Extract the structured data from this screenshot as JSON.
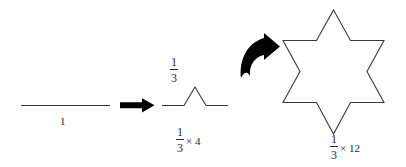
{
  "figure": {
    "background_color": "#ffffff",
    "stroke_color": "#3a3a3a",
    "arrow_color": "#000000",
    "stages": [
      {
        "name": "initiator-segment",
        "description": "single horizontal straight line segment",
        "label_text": "1",
        "length_label": "1",
        "segment_count": 1
      },
      {
        "name": "koch-generator",
        "description": "line with equilateral triangular bump, four segments",
        "height_label_numerator": "1",
        "height_label_denominator": "3",
        "length_label_numerator": "1",
        "length_label_denominator": "3",
        "length_label_multiplier": "× 4",
        "segment_count": 4
      },
      {
        "name": "koch-star-iteration",
        "description": "six pointed star outline, twelve segments",
        "length_label_numerator": "1",
        "length_label_denominator": "3",
        "length_label_multiplier": "× 12",
        "segment_count": 12
      }
    ],
    "arrows": [
      {
        "name": "straight-arrow",
        "style": "straight",
        "direction": "right"
      },
      {
        "name": "curved-arrow",
        "style": "curved",
        "direction": "up-right"
      }
    ],
    "labels": {
      "unit": "1",
      "third_numerator": "1",
      "third_denominator": "3",
      "third_times_four_numerator": "1",
      "third_times_four_denominator": "3",
      "third_times_four_multiplier": "× 4",
      "third_times_twelve_numerator": "1",
      "third_times_twelve_denominator": "3",
      "third_times_twelve_multiplier": "× 12"
    }
  }
}
